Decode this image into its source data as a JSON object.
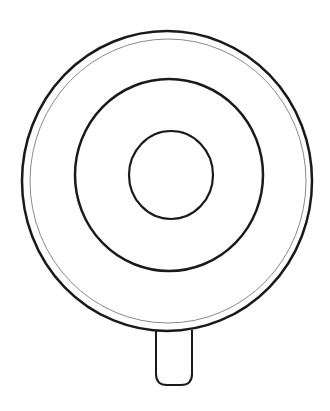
{
  "drawing": {
    "subject": "lollipop outline",
    "stroke_color": "#1a1a1a",
    "thin_ring_color": "#8a8a8a",
    "background": "#ffffff",
    "outer_circle": {
      "cx": 167,
      "cy": 181,
      "rx": 145,
      "ry": 150
    },
    "thin_ring": {
      "cx": 168,
      "cy": 181,
      "rx": 138,
      "ry": 142
    },
    "middle_ring": {
      "cx": 169,
      "cy": 175,
      "rx": 94,
      "ry": 96
    },
    "inner_circle": {
      "cx": 171,
      "cy": 175,
      "rx": 42,
      "ry": 44
    },
    "stick": {
      "x": 155,
      "y": 330,
      "width": 37,
      "height": 55
    }
  }
}
